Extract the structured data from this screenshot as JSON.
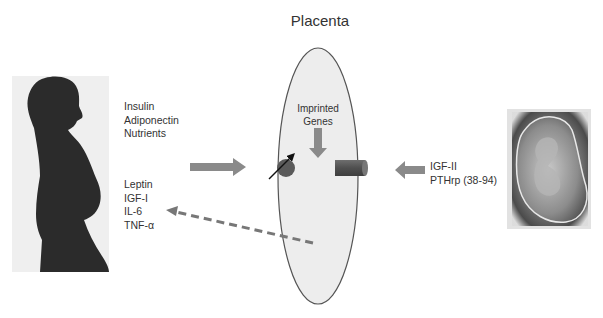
{
  "diagram": {
    "title": "Placenta",
    "maternal_signals_in": [
      "Insulin",
      "Adiponectin",
      "Nutrients"
    ],
    "placental_signals_out": [
      "Leptin",
      "IGF-I",
      "IL-6",
      "TNF-α"
    ],
    "placenta_inner_label": [
      "Imprinted",
      "Genes"
    ],
    "fetal_signals": [
      "IGF-II",
      "PTHrp (38-94)"
    ],
    "images": {
      "mother": "pregnant-woman-silhouette",
      "fetus": "fetus-in-womb"
    },
    "colors": {
      "arrow_fill": "#8a8a8a",
      "placenta_fill": "#ededed",
      "placenta_stroke": "#555555",
      "receptor_fill": "#5a5a5a",
      "dashed_arrow": "#777777",
      "silhouette": "#2a2a2a"
    }
  }
}
